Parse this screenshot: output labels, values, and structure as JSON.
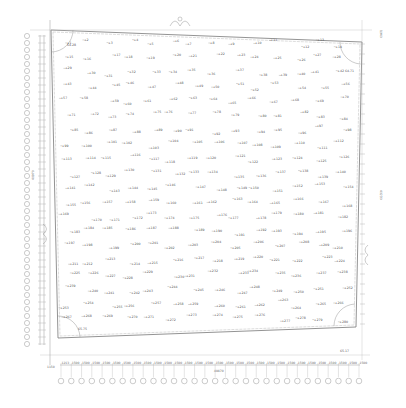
{
  "drawing": {
    "type": "site survey plan with spot elevations",
    "line_color": "#888888",
    "text_color": "#555555",
    "left_dimension_label": "40970",
    "right_dimension_label": "40230",
    "bottom_dimension_label": "40870",
    "top_right_label": "1940",
    "bottom_left_label": "1150",
    "corner_labels": {
      "top_left": "64.28",
      "top_right": "64.71",
      "bottom_left": "65.75",
      "bottom_right": "65.17"
    },
    "bottom_dimensions": [
      "1213",
      "1500",
      "1500",
      "1500",
      "1500",
      "1500",
      "1500",
      "1500",
      "1500",
      "1500",
      "1500",
      "1500",
      "1500",
      "1500",
      "1500",
      "1500",
      "1500",
      "1500",
      "1500",
      "1500",
      "1500",
      "1500",
      "1500",
      "1500",
      "1500",
      "1500",
      "1500",
      "1500",
      "1500",
      "1500",
      "1500",
      "1500",
      "1500",
      "1500",
      "1500",
      "1500",
      "1500",
      "1500",
      "1500",
      "1500",
      "1500",
      "1500",
      "1500",
      "1500",
      "1300",
      "1100"
    ],
    "spot_labels": [
      "+1",
      "+2",
      "+3",
      "+4",
      "+5",
      "+6",
      "+7",
      "+8",
      "+9",
      "+10",
      "+11",
      "+12",
      "+13",
      "+14",
      "+15",
      "+16",
      "+17",
      "+18",
      "+19",
      "+20",
      "+21",
      "+22",
      "+23",
      "+24",
      "+25",
      "+26",
      "+27",
      "+28",
      "+29",
      "+30",
      "+31",
      "+32",
      "+33",
      "+34",
      "+35",
      "+36",
      "+37",
      "+38",
      "+39",
      "+40",
      "+41",
      "+42",
      "+43",
      "+44",
      "+45",
      "+46",
      "+47",
      "+48",
      "+49",
      "+50",
      "+51",
      "+52",
      "+53",
      "+54",
      "+55",
      "+56",
      "+57",
      "+58",
      "+59",
      "+60",
      "+61",
      "+62",
      "+63",
      "+64",
      "+65",
      "+66",
      "+67",
      "+68",
      "+69",
      "+70",
      "+71",
      "+72",
      "+73",
      "+74",
      "+75",
      "+76",
      "+77",
      "+78",
      "+79",
      "+80",
      "+81",
      "+82",
      "+83",
      "+84",
      "+85",
      "+86",
      "+87",
      "+88",
      "+89",
      "+90",
      "+91",
      "+92",
      "+93",
      "+94",
      "+95",
      "+96",
      "+97",
      "+98",
      "+99",
      "+100",
      "+101",
      "+102",
      "+103",
      "+104",
      "+105",
      "+106",
      "+107",
      "+108",
      "+109",
      "+110",
      "+111",
      "+112",
      "+113",
      "+114",
      "+115",
      "+116",
      "+117",
      "+118",
      "+119",
      "+120",
      "+121",
      "+122",
      "+123",
      "+124",
      "+125",
      "+126",
      "+127",
      "+128",
      "+129",
      "+130",
      "+131",
      "+132",
      "+133",
      "+134",
      "+135",
      "+136",
      "+137",
      "+138",
      "+139",
      "+140",
      "+141",
      "+142",
      "+143",
      "+144",
      "+145",
      "+146",
      "+147",
      "+148",
      "+149",
      "+150",
      "+151",
      "+152",
      "+153",
      "+154",
      "+155",
      "+156",
      "+157",
      "+158",
      "+159",
      "+160",
      "+161",
      "+162",
      "+163",
      "+164",
      "+165",
      "+166",
      "+167",
      "+168",
      "+169",
      "+170",
      "+171",
      "+172",
      "+173",
      "+174",
      "+175",
      "+176",
      "+177",
      "+178",
      "+179",
      "+180",
      "+181",
      "+182",
      "+183",
      "+184",
      "+185",
      "+186",
      "+187",
      "+188",
      "+189",
      "+190",
      "+191",
      "+192",
      "+193",
      "+194",
      "+195",
      "+196",
      "+197",
      "+198",
      "+199",
      "+200",
      "+201",
      "+202",
      "+203",
      "+204",
      "+205",
      "+206",
      "+207",
      "+208",
      "+209",
      "+210",
      "+211",
      "+212",
      "+213",
      "+214",
      "+215",
      "+216",
      "+217",
      "+218",
      "+219",
      "+220",
      "+221",
      "+222",
      "+223",
      "+224",
      "+225",
      "+226",
      "+227",
      "+228",
      "+229",
      "+230",
      "+231",
      "+232",
      "+233",
      "+234",
      "+235",
      "+236",
      "+237",
      "+238",
      "+239",
      "+240",
      "+241",
      "+242",
      "+243",
      "+244",
      "+245",
      "+246",
      "+247",
      "+248",
      "+249",
      "+250",
      "+251",
      "+252",
      "+253",
      "+254",
      "+255",
      "+256",
      "+257",
      "+258",
      "+259",
      "+260",
      "+261",
      "+262",
      "+263",
      "+264",
      "+265",
      "+266",
      "+267",
      "+268",
      "+269",
      "+270",
      "+271",
      "+272",
      "+273",
      "+274",
      "+275",
      "+276",
      "+277",
      "+278",
      "+279",
      "+280"
    ]
  }
}
